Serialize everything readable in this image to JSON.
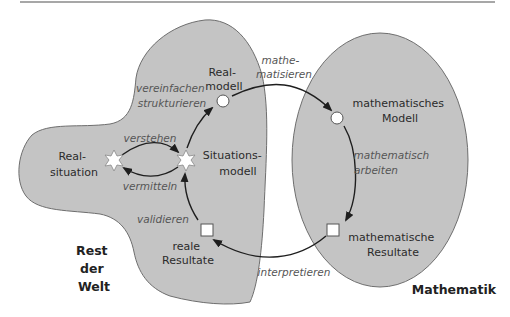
{
  "diagram": {
    "type": "modelling-cycle",
    "regions": {
      "rest_der_welt": {
        "lines": [
          "Rest",
          "der",
          "Welt"
        ],
        "fill": "#c4c4c4"
      },
      "mathematik": {
        "label": "Mathematik",
        "fill": "#c4c4c4"
      }
    },
    "nodes": {
      "realsituation": {
        "lines": [
          "Real-",
          "situation"
        ],
        "shape": "star"
      },
      "situationsmodell": {
        "lines": [
          "Situations-",
          "modell"
        ],
        "shape": "star"
      },
      "realmodell": {
        "lines": [
          "Real-",
          "modell"
        ],
        "shape": "circle"
      },
      "mathematisches_modell": {
        "lines": [
          "mathematisches",
          "Modell"
        ],
        "shape": "circle"
      },
      "mathematische_resultate": {
        "lines": [
          "mathematische",
          "Resultate"
        ],
        "shape": "square"
      },
      "reale_resultate": {
        "lines": [
          "reale",
          "Resultate"
        ],
        "shape": "square"
      }
    },
    "edges": {
      "verstehen": "verstehen",
      "vermitteln": "vermitteln",
      "vereinfachen": [
        "vereinfachen",
        "strukturieren"
      ],
      "mathematisieren": [
        "mathe-",
        "matisieren"
      ],
      "mathematisch_arbeiten": [
        "mathematisch",
        "arbeiten"
      ],
      "interpretieren": "interpretieren",
      "validieren": "validieren"
    },
    "colors": {
      "region_fill": "#c4c4c4",
      "region_stroke": "#6e6e6e",
      "arrow": "#1e1e1e",
      "verb_text": "#555555"
    }
  }
}
